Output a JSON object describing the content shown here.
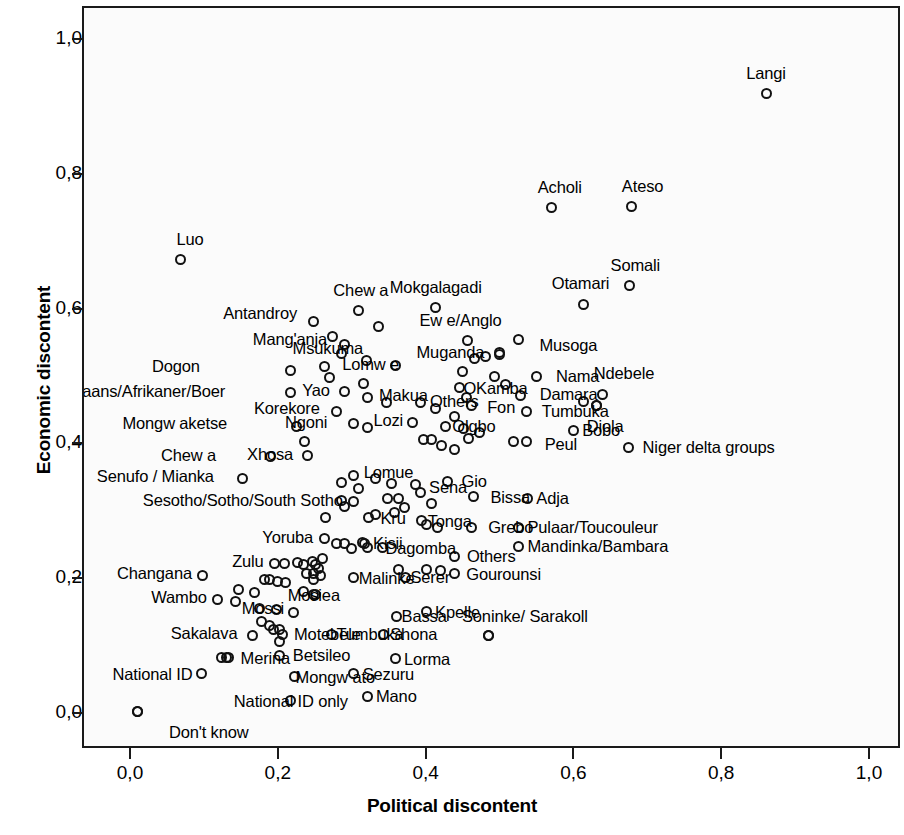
{
  "chart_data": {
    "type": "scatter",
    "title": "",
    "xlabel": "Political discontent",
    "ylabel": "Economic discontent",
    "xlim": [
      0.0,
      1.0
    ],
    "ylim": [
      0.0,
      1.0
    ],
    "grid": false,
    "legend": null,
    "x_ticks": [
      "0,0",
      "0,2",
      "0,4",
      "0,6",
      "0,8",
      "1,0"
    ],
    "y_ticks": [
      "0,0",
      "0,2",
      "0,4",
      "0,6",
      "0,8",
      "1,0"
    ],
    "x_tick_values": [
      0.0,
      0.2,
      0.4,
      0.6,
      0.8,
      1.0
    ],
    "y_tick_values": [
      0.0,
      0.2,
      0.4,
      0.6,
      0.8,
      1.0
    ],
    "marker": "open-circle",
    "points": [
      {
        "label": "Langi",
        "x": 0.858,
        "y": 0.921,
        "lpos": "c",
        "ldx": 0,
        "ldy": -20
      },
      {
        "label": "Acholi",
        "x": 0.568,
        "y": 0.752,
        "lpos": "c",
        "ldx": 8,
        "ldy": -20
      },
      {
        "label": "Ateso",
        "x": 0.676,
        "y": 0.753,
        "lpos": "c",
        "ldx": 11,
        "ldy": -20
      },
      {
        "label": "Luo",
        "x": 0.065,
        "y": 0.674,
        "lpos": "c",
        "ldx": 10,
        "ldy": -21
      },
      {
        "label": "Somali",
        "x": 0.673,
        "y": 0.636,
        "lpos": "c",
        "ldx": 6,
        "ldy": -20
      },
      {
        "label": "Otamari",
        "x": 0.611,
        "y": 0.608,
        "lpos": "c",
        "ldx": -3,
        "ldy": -21
      },
      {
        "label": "Mokgalagadi",
        "x": 0.411,
        "y": 0.603,
        "lpos": "c",
        "ldx": 0,
        "ldy": -21
      },
      {
        "label": "Chew a",
        "x": 0.307,
        "y": 0.598,
        "lpos": "c",
        "ldx": 2,
        "ldy": -21
      },
      {
        "label": "Antandroy",
        "x": 0.245,
        "y": 0.583,
        "lpos": "r",
        "ldx": -7,
        "ldy": -8
      },
      {
        "label": "Msukuma",
        "x": 0.333,
        "y": 0.575,
        "lpos": "r",
        "ldx": -6,
        "ldy": 22
      },
      {
        "label": "Ew e/Anglo",
        "x": 0.454,
        "y": 0.554,
        "lpos": "c",
        "ldx": -7,
        "ldy": -21
      },
      {
        "label": "Musoga",
        "x": 0.523,
        "y": 0.555,
        "lpos": "l",
        "ldx": 12,
        "ldy": 5
      },
      {
        "label": "Mang'anja",
        "x": 0.287,
        "y": 0.548,
        "lpos": "r",
        "ldx": -8,
        "ldy": -6
      },
      {
        "label": "Muganda",
        "x": 0.497,
        "y": 0.536,
        "lpos": "r",
        "ldx": -6,
        "ldy": -1
      },
      {
        "label": "Lomw e",
        "x": 0.26,
        "y": 0.516,
        "lpos": "l",
        "ldx": 9,
        "ldy": -2
      },
      {
        "label": "Dogon",
        "x": 0.215,
        "y": 0.51,
        "lpos": "r",
        "ldx": -82,
        "ldy": -4
      },
      {
        "label": "Nama",
        "x": 0.548,
        "y": 0.501,
        "lpos": "l",
        "ldx": 10,
        "ldy": 0
      },
      {
        "label": "OKamba",
        "x": 0.443,
        "y": 0.484,
        "lpos": "l",
        "ldx": -5,
        "ldy": 0
      },
      {
        "label": "Afrikaans/Afrikaner/Boer",
        "x": 0.214,
        "y": 0.477,
        "lpos": "r",
        "ldx": -56,
        "ldy": -2
      },
      {
        "label": "Yao",
        "x": 0.288,
        "y": 0.478,
        "lpos": "r",
        "ldx": -6,
        "ldy": -2
      },
      {
        "label": "Ndebele",
        "x": 0.636,
        "y": 0.474,
        "lpos": "c",
        "ldx": 22,
        "ldy": -22
      },
      {
        "label": "Makua",
        "x": 0.318,
        "y": 0.469,
        "lpos": "l",
        "ldx": 3,
        "ldy": -3
      },
      {
        "label": "Damara",
        "x": 0.526,
        "y": 0.472,
        "lpos": "l",
        "ldx": 10,
        "ldy": -2
      },
      {
        "label": "Others",
        "x": 0.391,
        "y": 0.462,
        "lpos": "l",
        "ldx": 0,
        "ldy": -2
      },
      {
        "label": "Fon",
        "x": 0.459,
        "y": 0.458,
        "lpos": "l",
        "ldx": 7,
        "ldy": 2
      },
      {
        "label": "Korekore",
        "x": 0.277,
        "y": 0.449,
        "lpos": "r",
        "ldx": -8,
        "ldy": -3
      },
      {
        "label": "Tumbuka",
        "x": 0.534,
        "y": 0.449,
        "lpos": "l",
        "ldx": 6,
        "ldy": 0
      },
      {
        "label": "Diola",
        "x": 0.628,
        "y": 0.457,
        "lpos": "c",
        "ldx": 9,
        "ldy": 20
      },
      {
        "label": "Lozi",
        "x": 0.379,
        "y": 0.433,
        "lpos": "r",
        "ldx": 0,
        "ldy": -2
      },
      {
        "label": "Olgbo",
        "x": 0.424,
        "y": 0.427,
        "lpos": "l",
        "ldx": -2,
        "ldy": 0
      },
      {
        "label": "Mongw aketse",
        "x": 0.222,
        "y": 0.426,
        "lpos": "r",
        "ldx": -60,
        "ldy": -4
      },
      {
        "label": "Peul",
        "x": 0.534,
        "y": 0.405,
        "lpos": "l",
        "ldx": 9,
        "ldy": 3
      },
      {
        "label": "Bobo",
        "x": 0.597,
        "y": 0.421,
        "lpos": "l",
        "ldx": 0,
        "ldy": 0
      },
      {
        "label": "Ngoni",
        "x": 0.233,
        "y": 0.404,
        "lpos": "c",
        "ldx": 2,
        "ldy": -20
      },
      {
        "label": "Xhosa",
        "x": 0.237,
        "y": 0.383,
        "lpos": "r",
        "ldx": -5,
        "ldy": -2
      },
      {
        "label": "Chew a",
        "x": 0.188,
        "y": 0.382,
        "lpos": "r",
        "ldx": -46,
        "ldy": -2
      },
      {
        "label": "Niger delta groups",
        "x": 0.672,
        "y": 0.396,
        "lpos": "l",
        "ldx": 5,
        "ldy": 0
      },
      {
        "label": "Lomue",
        "x": 0.3,
        "y": 0.354,
        "lpos": "l",
        "ldx": 1,
        "ldy": -3
      },
      {
        "label": "Sena",
        "x": 0.383,
        "y": 0.34,
        "lpos": "l",
        "ldx": 5,
        "ldy": 2
      },
      {
        "label": "Gio",
        "x": 0.427,
        "y": 0.345,
        "lpos": "l",
        "ldx": 5,
        "ldy": 0
      },
      {
        "label": "Senufo / Mianka",
        "x": 0.15,
        "y": 0.35,
        "lpos": "r",
        "ldx": -20,
        "ldy": -2
      },
      {
        "label": "Bissa",
        "x": 0.462,
        "y": 0.322,
        "lpos": "l",
        "ldx": 8,
        "ldy": 0
      },
      {
        "label": "Adja",
        "x": 0.535,
        "y": 0.32,
        "lpos": "l",
        "ldx": 0,
        "ldy": 0
      },
      {
        "label": "Sesotho/Sotho/South Sotho",
        "x": 0.3,
        "y": 0.315,
        "lpos": "r",
        "ldx": -2,
        "ldy": -2
      },
      {
        "label": "Kru",
        "x": 0.32,
        "y": 0.291,
        "lpos": "l",
        "ldx": 3,
        "ldy": 0
      },
      {
        "label": "Tonga",
        "x": 0.392,
        "y": 0.287,
        "lpos": "l",
        "ldx": -3,
        "ldy": 0
      },
      {
        "label": "Grebo",
        "x": 0.459,
        "y": 0.277,
        "lpos": "l",
        "ldx": 8,
        "ldy": 0
      },
      {
        "label": "Pulaar/Toucouleur",
        "x": 0.523,
        "y": 0.277,
        "lpos": "l",
        "ldx": 0,
        "ldy": 0
      },
      {
        "label": "Yoruba",
        "x": 0.26,
        "y": 0.26,
        "lpos": "r",
        "ldx": -2,
        "ldy": -2
      },
      {
        "label": "Kisii",
        "x": 0.314,
        "y": 0.253,
        "lpos": "l",
        "ldx": 0,
        "ldy": 0
      },
      {
        "label": "Dagomba",
        "x": 0.339,
        "y": 0.247,
        "lpos": "l",
        "ldx": -6,
        "ldy": 0
      },
      {
        "label": "Mandinka/Bambara",
        "x": 0.523,
        "y": 0.249,
        "lpos": "l",
        "ldx": 0,
        "ldy": 0
      },
      {
        "label": "Others",
        "x": 0.437,
        "y": 0.234,
        "lpos": "l",
        "ldx": 3,
        "ldy": 0
      },
      {
        "label": "Zulu",
        "x": 0.193,
        "y": 0.224,
        "lpos": "r",
        "ldx": -2,
        "ldy": -2
      },
      {
        "label": "Malinke",
        "x": 0.3,
        "y": 0.202,
        "lpos": "l",
        "ldx": -4,
        "ldy": 0
      },
      {
        "label": "Serer",
        "x": 0.37,
        "y": 0.203,
        "lpos": "l",
        "ldx": -4,
        "ldy": 0
      },
      {
        "label": "Gourounsi",
        "x": 0.436,
        "y": 0.208,
        "lpos": "l",
        "ldx": 3,
        "ldy": 0
      },
      {
        "label": "Changana",
        "x": 0.096,
        "y": 0.206,
        "lpos": "r",
        "ldx": -2,
        "ldy": -2
      },
      {
        "label": "Mosiea",
        "x": 0.246,
        "y": 0.177,
        "lpos": "c",
        "ldx": 0,
        "ldy": 0
      },
      {
        "label": "Wambo",
        "x": 0.116,
        "y": 0.17,
        "lpos": "r",
        "ldx": -2,
        "ldy": -2
      },
      {
        "label": "Mossi",
        "x": 0.173,
        "y": 0.157,
        "lpos": "c",
        "ldx": 3,
        "ldy": 0
      },
      {
        "label": "Bassa",
        "x": 0.358,
        "y": 0.145,
        "lpos": "l",
        "ldx": -4,
        "ldy": 0
      },
      {
        "label": "Kpelle",
        "x": 0.398,
        "y": 0.152,
        "lpos": "l",
        "ldx": 0,
        "ldy": 0
      },
      {
        "label": "Soninke/ Sarakoll",
        "x": 0.483,
        "y": 0.117,
        "lpos": "c",
        "ldx": 36,
        "ldy": -19
      },
      {
        "label": "Sakalava",
        "x": 0.163,
        "y": 0.117,
        "lpos": "r",
        "ldx": -6,
        "ldy": -2
      },
      {
        "label": "Motebele",
        "x": 0.203,
        "y": 0.118,
        "lpos": "l",
        "ldx": 3,
        "ldy": 0
      },
      {
        "label": "Tumbuka",
        "x": 0.27,
        "y": 0.118,
        "lpos": "l",
        "ldx": -4,
        "ldy": 0
      },
      {
        "label": "Shona",
        "x": 0.34,
        "y": 0.118,
        "lpos": "l",
        "ldx": -2,
        "ldy": 0
      },
      {
        "label": "Merina",
        "x": 0.128,
        "y": 0.084,
        "lpos": "l",
        "ldx": 5,
        "ldy": 1
      },
      {
        "label": "Betsileo",
        "x": 0.2,
        "y": 0.087,
        "lpos": "l",
        "ldx": 4,
        "ldy": 0
      },
      {
        "label": "Lorma",
        "x": 0.356,
        "y": 0.082,
        "lpos": "l",
        "ldx": 0,
        "ldy": 0
      },
      {
        "label": "National ID",
        "x": 0.094,
        "y": 0.06,
        "lpos": "r",
        "ldx": 0,
        "ldy": 0
      },
      {
        "label": "Mongw ato",
        "x": 0.22,
        "y": 0.055,
        "lpos": "l",
        "ldx": -8,
        "ldy": 0
      },
      {
        "label": "Sezuru",
        "x": 0.3,
        "y": 0.06,
        "lpos": "l",
        "ldx": 0,
        "ldy": 0
      },
      {
        "label": "Don't know",
        "x": 0.008,
        "y": 0.003,
        "lpos": "l",
        "ldx": 22,
        "ldy": 20
      },
      {
        "label": "National ID only",
        "x": 0.215,
        "y": 0.02,
        "lpos": "c",
        "ldx": 0,
        "ldy": 0
      },
      {
        "label": "Mano",
        "x": 0.318,
        "y": 0.026,
        "lpos": "l",
        "ldx": 0,
        "ldy": 0
      }
    ],
    "unlabeled_points": [
      [
        0.271,
        0.56
      ],
      [
        0.283,
        0.535
      ],
      [
        0.317,
        0.524
      ],
      [
        0.357,
        0.517
      ],
      [
        0.463,
        0.527
      ],
      [
        0.478,
        0.53
      ],
      [
        0.497,
        0.534
      ],
      [
        0.447,
        0.508
      ],
      [
        0.267,
        0.499
      ],
      [
        0.313,
        0.491
      ],
      [
        0.491,
        0.501
      ],
      [
        0.505,
        0.489
      ],
      [
        0.452,
        0.469
      ],
      [
        0.345,
        0.462
      ],
      [
        0.3,
        0.431
      ],
      [
        0.319,
        0.425
      ],
      [
        0.411,
        0.454
      ],
      [
        0.437,
        0.442
      ],
      [
        0.449,
        0.424
      ],
      [
        0.455,
        0.409
      ],
      [
        0.47,
        0.417
      ],
      [
        0.395,
        0.407
      ],
      [
        0.405,
        0.407
      ],
      [
        0.419,
        0.398
      ],
      [
        0.437,
        0.392
      ],
      [
        0.611,
        0.464
      ],
      [
        0.628,
        0.457
      ],
      [
        0.516,
        0.405
      ],
      [
        0.283,
        0.343
      ],
      [
        0.307,
        0.335
      ],
      [
        0.329,
        0.349
      ],
      [
        0.351,
        0.342
      ],
      [
        0.346,
        0.32
      ],
      [
        0.36,
        0.32
      ],
      [
        0.391,
        0.328
      ],
      [
        0.369,
        0.307
      ],
      [
        0.405,
        0.312
      ],
      [
        0.284,
        0.317
      ],
      [
        0.287,
        0.308
      ],
      [
        0.33,
        0.296
      ],
      [
        0.355,
        0.299
      ],
      [
        0.262,
        0.291
      ],
      [
        0.398,
        0.281
      ],
      [
        0.414,
        0.276
      ],
      [
        0.277,
        0.253
      ],
      [
        0.288,
        0.253
      ],
      [
        0.297,
        0.246
      ],
      [
        0.312,
        0.255
      ],
      [
        0.318,
        0.247
      ],
      [
        0.207,
        0.224
      ],
      [
        0.224,
        0.225
      ],
      [
        0.232,
        0.222
      ],
      [
        0.244,
        0.227
      ],
      [
        0.248,
        0.222
      ],
      [
        0.253,
        0.216
      ],
      [
        0.258,
        0.231
      ],
      [
        0.236,
        0.208
      ],
      [
        0.245,
        0.208
      ],
      [
        0.255,
        0.206
      ],
      [
        0.246,
        0.2
      ],
      [
        0.36,
        0.215
      ],
      [
        0.398,
        0.215
      ],
      [
        0.418,
        0.213
      ],
      [
        0.179,
        0.2
      ],
      [
        0.186,
        0.199
      ],
      [
        0.197,
        0.196
      ],
      [
        0.208,
        0.195
      ],
      [
        0.144,
        0.184
      ],
      [
        0.166,
        0.18
      ],
      [
        0.14,
        0.167
      ],
      [
        0.232,
        0.182
      ],
      [
        0.248,
        0.178
      ],
      [
        0.196,
        0.155
      ],
      [
        0.219,
        0.151
      ],
      [
        0.175,
        0.137
      ],
      [
        0.186,
        0.131
      ],
      [
        0.192,
        0.126
      ],
      [
        0.2,
        0.126
      ],
      [
        0.199,
        0.107
      ],
      [
        0.483,
        0.117
      ],
      [
        0.121,
        0.084
      ],
      [
        0.131,
        0.084
      ],
      [
        0.008,
        0.003
      ]
    ]
  }
}
